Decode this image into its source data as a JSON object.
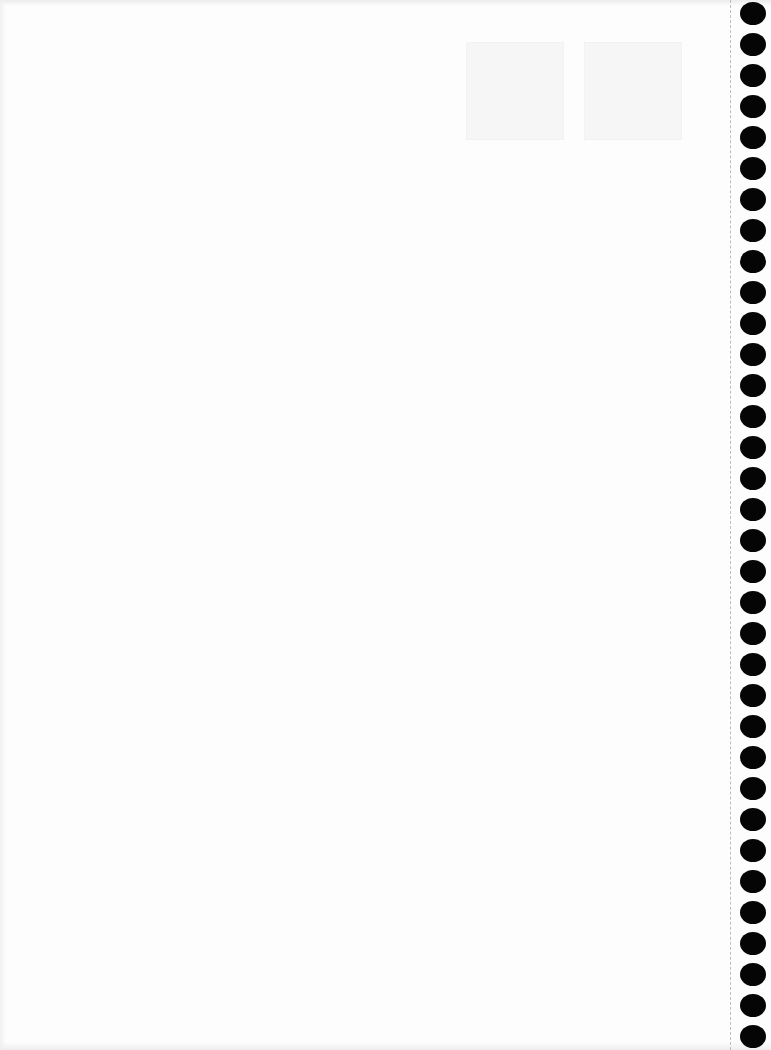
{
  "document": {
    "type": "blank notebook page",
    "text": ""
  },
  "binding": {
    "hole_count": 34,
    "hole_color": "#050505",
    "perforation_color": "#bdbdbd"
  }
}
